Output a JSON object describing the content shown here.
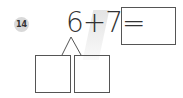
{
  "problem": {
    "number": "14",
    "expression": "6+7=",
    "left_operand": "6",
    "operator": "+",
    "right_operand": "7",
    "answer_box_value": "",
    "split_boxes": [
      "",
      ""
    ]
  },
  "colors": {
    "badge": "#d9d9d9",
    "stroke": "#555555",
    "text": "#333333"
  }
}
